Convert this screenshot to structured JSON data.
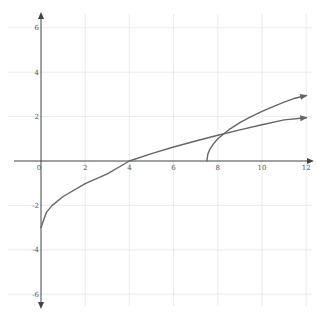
{
  "chart_data": {
    "type": "line",
    "title": "",
    "xlabel": "",
    "ylabel": "",
    "xlim": [
      -1.5,
      12.4
    ],
    "ylim": [
      -6.5,
      6.4
    ],
    "grid": true,
    "legend": null,
    "x_ticks": [
      0,
      2,
      4,
      6,
      8,
      10,
      12
    ],
    "y_ticks": [
      6,
      4,
      2,
      -2,
      -4,
      -6
    ],
    "x_tick_labels": [
      "0",
      "2",
      "4",
      "6",
      "8",
      "10",
      "12"
    ],
    "y_tick_labels": [
      "6",
      "4",
      "2",
      "-2",
      "-4",
      "-6"
    ],
    "series": [
      {
        "name": "curve-1",
        "description": "square-root curve from (0,-3) through (4,0), arrow at right end",
        "x": [
          0,
          0.25,
          0.5,
          1,
          2,
          3,
          4,
          5,
          6,
          7,
          8,
          9,
          10,
          11,
          12
        ],
        "y": [
          -3,
          -2.3,
          -2.01,
          -1.6,
          -1.02,
          -0.58,
          0,
          0.33,
          0.63,
          0.9,
          1.16,
          1.4,
          1.63,
          1.85,
          1.95
        ]
      },
      {
        "name": "curve-2",
        "description": "square-root curve starting at (7.5,0), arrow at right end",
        "x": [
          7.5,
          7.55,
          7.65,
          7.8,
          8,
          8.5,
          9,
          9.5,
          10,
          10.5,
          11,
          11.5,
          12
        ],
        "y": [
          0,
          0.32,
          0.55,
          0.77,
          1.0,
          1.41,
          1.73,
          2.0,
          2.24,
          2.45,
          2.65,
          2.83,
          2.95
        ]
      }
    ],
    "annotations": [
      "origin label 0 below x-axis at x=0"
    ],
    "colors": {
      "curve": "#666666",
      "axis": "#444444",
      "grid": "#e6e6e6"
    }
  }
}
